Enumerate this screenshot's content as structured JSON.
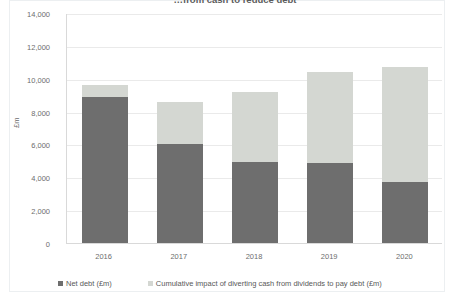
{
  "chart_data": {
    "type": "bar",
    "subtype": "stacked",
    "title": "…from cash to reduce debt",
    "xlabel": "",
    "ylabel": "£m",
    "ylim": [
      0,
      14000
    ],
    "ytick_values": [
      14000,
      12000,
      10000,
      8000,
      6000,
      4000,
      2000,
      0
    ],
    "ytick_labels": [
      "14,000",
      "12,000",
      "10,000",
      "8,000",
      "6,000",
      "4,000",
      "2,000",
      "0"
    ],
    "categories": [
      "2016",
      "2017",
      "2018",
      "2019",
      "2020"
    ],
    "grid": true,
    "legend_position": "bottom",
    "series": [
      {
        "name": "Net debt (£m)",
        "color": "#6e6e6e",
        "values": [
          8900,
          6000,
          4950,
          4900,
          3700
        ]
      },
      {
        "name": "Cumulative impact of diverting cash from dividends to pay debt (£m)",
        "color": "#d4d7d2",
        "values": [
          700,
          2600,
          4250,
          5500,
          7000
        ]
      }
    ],
    "totals": [
      9600,
      8600,
      9200,
      10400,
      10700
    ]
  },
  "colors": {
    "net_debt": "#6e6e6e",
    "cumulative_impact": "#d4d7d2",
    "gridline": "#eaeaea",
    "axis": "#d9d9d9",
    "text": "#6d6d6d",
    "background": "#ffffff"
  }
}
